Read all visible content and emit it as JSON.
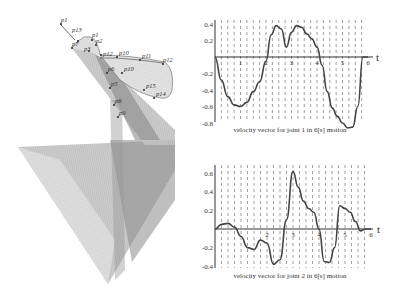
{
  "figure": {
    "left_panel": {
      "description": "3D swept surface of robot joint motion with via points",
      "point_labels": [
        "p1",
        "p13",
        "p1",
        "p2",
        "p7",
        "p3",
        "p12",
        "p10",
        "p11",
        "p12",
        "p10",
        "p15",
        "p14",
        "p6",
        "p5",
        "p8",
        "p9"
      ]
    }
  },
  "chart_data": [
    {
      "type": "line",
      "title": "velocity vector for joint 1 in 6[s] motion",
      "xlabel": "t",
      "ylabel": "",
      "xlim": [
        0,
        6
      ],
      "ylim": [
        -0.85,
        0.42
      ],
      "x_ticks": [
        "1",
        "2",
        "3",
        "4",
        "5",
        "6"
      ],
      "y_ticks": [
        "0.4",
        "0.2",
        "-0.2",
        "-0.4",
        "-0.6",
        "-0.8"
      ],
      "grid": "vertical dashed",
      "x": [
        0,
        0.25,
        0.5,
        0.75,
        1.0,
        1.25,
        1.5,
        1.75,
        2.0,
        2.2,
        2.4,
        2.6,
        2.8,
        3.0,
        3.2,
        3.4,
        3.6,
        3.8,
        4.0,
        4.2,
        4.4,
        4.6,
        4.8,
        5.0,
        5.2,
        5.4,
        5.6,
        5.8,
        5.9,
        6.0
      ],
      "series": [
        {
          "name": "joint 1 velocity",
          "values": [
            0,
            -0.28,
            -0.48,
            -0.58,
            -0.6,
            -0.55,
            -0.42,
            -0.3,
            -0.05,
            0.27,
            0.38,
            0.34,
            0.12,
            0.3,
            0.38,
            0.36,
            0.28,
            0.22,
            0.12,
            -0.1,
            -0.42,
            -0.62,
            -0.72,
            -0.8,
            -0.86,
            -0.85,
            -0.6,
            0,
            0,
            0
          ]
        }
      ]
    },
    {
      "type": "line",
      "title": "velocity vector for joint 2 in 6[s] motion",
      "xlabel": "t",
      "ylabel": "",
      "xlim": [
        0,
        6
      ],
      "ylim": [
        -0.42,
        0.68
      ],
      "x_ticks": [
        "2",
        "3",
        "4",
        "5",
        "6"
      ],
      "y_ticks": [
        "0.6",
        "0.4",
        "0.2",
        "-0.2",
        "-0.4"
      ],
      "grid": "vertical dashed",
      "x": [
        0,
        0.25,
        0.5,
        0.75,
        1.0,
        1.25,
        1.5,
        1.75,
        2.0,
        2.25,
        2.5,
        2.75,
        3.0,
        3.2,
        3.4,
        3.6,
        3.8,
        4.0,
        4.2,
        4.4,
        4.6,
        4.8,
        5.0,
        5.2,
        5.4,
        5.6,
        5.8,
        6.0
      ],
      "series": [
        {
          "name": "joint 2 velocity",
          "values": [
            0,
            0.05,
            0.06,
            0.02,
            -0.08,
            -0.2,
            -0.22,
            -0.12,
            -0.15,
            -0.38,
            -0.33,
            0.1,
            0.62,
            0.45,
            0.3,
            0.22,
            0.18,
            0.0,
            -0.35,
            -0.36,
            -0.2,
            0.25,
            0.22,
            0.18,
            0.08,
            -0.02,
            0.0,
            0.0
          ]
        }
      ]
    }
  ]
}
